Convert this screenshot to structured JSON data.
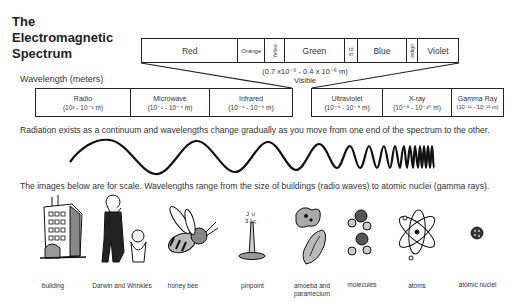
{
  "title": {
    "line1": "The",
    "line2": "Electromagnetic",
    "line3": "Spectrum"
  },
  "wavelength_label": "Wavelength (meters)",
  "visible": {
    "colors": [
      {
        "label": "Red",
        "width": 97
      },
      {
        "label": "Orange",
        "width": 27
      },
      {
        "label": "Yellow",
        "width": 20,
        "rotated": true
      },
      {
        "label": "Green",
        "width": 60
      },
      {
        "label": "B.G.",
        "width": 13,
        "rotated": true
      },
      {
        "label": "Blue",
        "width": 50
      },
      {
        "label": "Indigo",
        "width": 11,
        "rotated": true
      },
      {
        "label": "Violet",
        "width": 40
      }
    ],
    "range": "(0.7 x10⁻⁶ - 0.4 x 10⁻⁶ m)",
    "label": "Visible"
  },
  "bands_left": [
    {
      "name": "Radio",
      "range": "(10³ - 10⁻¹ m)",
      "width": 95
    },
    {
      "name": "Microwave",
      "range": "(10⁻¹ - 10⁻⁴ m)",
      "width": 79
    },
    {
      "name": "Infrared",
      "range": "(10⁻⁴ - 10⁻⁶ m)",
      "width": 83
    }
  ],
  "bands_right": [
    {
      "name": "Ultraviolet",
      "range": "(10⁻⁶ - 10⁻⁸ m)",
      "width": 71
    },
    {
      "name": "X-ray",
      "range": "(10⁻⁸ - 10⁻¹⁰ m)",
      "width": 69
    },
    {
      "name": "Gamma Ray",
      "range": "(10⁻¹¹ - 10⁻¹² m)",
      "width": 51
    }
  ],
  "sentence_continuum": "Radiation exists as a continuum and wavelengths change gradually as you move from one end of the spectrum to the other.",
  "sentence_scale": "The images below are for scale. Wavelengths range from the size of buildings (radio waves) to atomic nuclei (gamma rays).",
  "scale_items": [
    {
      "label": "building",
      "icon": "building-icon"
    },
    {
      "label": "Darwin and Wrinkles",
      "icon": "person-and-dog-icon"
    },
    {
      "label": "honey bee",
      "icon": "honey-bee-icon"
    },
    {
      "label": "pinpoint",
      "icon": "pinpoint-icon"
    },
    {
      "label": "amoeba and paramecium",
      "icon": "amoeba-icon"
    },
    {
      "label": "molecules",
      "icon": "molecules-icon"
    },
    {
      "label": "atoms",
      "icon": "atom-icon"
    },
    {
      "label": "atomic nuclei",
      "icon": "atomic-nucleus-icon"
    }
  ],
  "colors": {
    "line": "#222222",
    "text": "#333333",
    "fill_light": "#bbbbbb",
    "fill_dark": "#555555"
  }
}
